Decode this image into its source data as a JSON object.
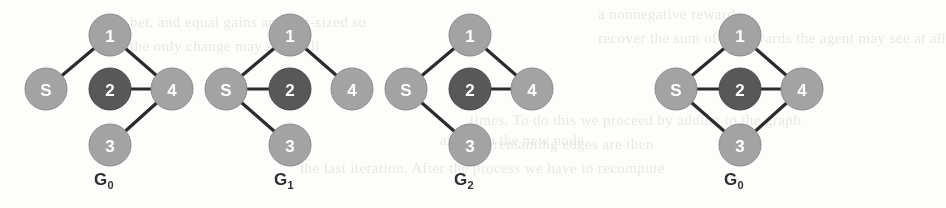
{
  "figure": {
    "background_color": "#fdfdfc",
    "width": 853,
    "height": 208,
    "node_colors": {
      "light": "#a3a3a3",
      "dark": "#585858",
      "stroke": "#8a8a8a",
      "dark_stroke": "#4a4a4a",
      "edge": "#2b2b2b",
      "label_text": "#ffffff"
    },
    "node_radius": 21,
    "edge_width": 3.2,
    "graphs": [
      {
        "id": "graph-g0-left",
        "caption_base": "G",
        "caption_sub": "0",
        "caption_x": 104,
        "caption_y": 170,
        "center_x": 104,
        "nodes": [
          {
            "id": "1",
            "label": "1",
            "x": 110,
            "y": 35,
            "shade": "light"
          },
          {
            "id": "S",
            "label": "S",
            "x": 46,
            "y": 89,
            "shade": "light"
          },
          {
            "id": "2",
            "label": "2",
            "x": 110,
            "y": 89,
            "shade": "dark"
          },
          {
            "id": "4",
            "label": "4",
            "x": 172,
            "y": 89,
            "shade": "light"
          },
          {
            "id": "3",
            "label": "3",
            "x": 110,
            "y": 145,
            "shade": "light"
          }
        ],
        "edges": [
          {
            "from": "S",
            "to": "1"
          },
          {
            "from": "1",
            "to": "4"
          },
          {
            "from": "2",
            "to": "4"
          },
          {
            "from": "3",
            "to": "4"
          }
        ]
      },
      {
        "id": "graph-g1",
        "caption_base": "G",
        "caption_sub": "1",
        "caption_x": 284,
        "caption_y": 170,
        "center_x": 284,
        "nodes": [
          {
            "id": "1",
            "label": "1",
            "x": 290,
            "y": 35,
            "shade": "light"
          },
          {
            "id": "S",
            "label": "S",
            "x": 226,
            "y": 89,
            "shade": "light"
          },
          {
            "id": "2",
            "label": "2",
            "x": 290,
            "y": 89,
            "shade": "dark"
          },
          {
            "id": "4",
            "label": "4",
            "x": 352,
            "y": 89,
            "shade": "light"
          },
          {
            "id": "3",
            "label": "3",
            "x": 290,
            "y": 145,
            "shade": "light"
          }
        ],
        "edges": [
          {
            "from": "S",
            "to": "1"
          },
          {
            "from": "S",
            "to": "2"
          },
          {
            "from": "S",
            "to": "3"
          },
          {
            "from": "1",
            "to": "4"
          }
        ]
      },
      {
        "id": "graph-g2",
        "caption_base": "G",
        "caption_sub": "2",
        "caption_x": 464,
        "caption_y": 170,
        "center_x": 464,
        "nodes": [
          {
            "id": "1",
            "label": "1",
            "x": 470,
            "y": 35,
            "shade": "light"
          },
          {
            "id": "S",
            "label": "S",
            "x": 406,
            "y": 89,
            "shade": "light"
          },
          {
            "id": "2",
            "label": "2",
            "x": 470,
            "y": 89,
            "shade": "dark"
          },
          {
            "id": "4",
            "label": "4",
            "x": 532,
            "y": 89,
            "shade": "light"
          },
          {
            "id": "3",
            "label": "3",
            "x": 470,
            "y": 145,
            "shade": "light"
          }
        ],
        "edges": [
          {
            "from": "S",
            "to": "1"
          },
          {
            "from": "S",
            "to": "3"
          },
          {
            "from": "1",
            "to": "4"
          },
          {
            "from": "2",
            "to": "4"
          }
        ]
      },
      {
        "id": "graph-g0-right",
        "caption_base": "G",
        "caption_sub": "0",
        "caption_x": 734,
        "caption_y": 170,
        "center_x": 734,
        "nodes": [
          {
            "id": "1",
            "label": "1",
            "x": 740,
            "y": 35,
            "shade": "light"
          },
          {
            "id": "S",
            "label": "S",
            "x": 676,
            "y": 89,
            "shade": "light"
          },
          {
            "id": "2",
            "label": "2",
            "x": 740,
            "y": 89,
            "shade": "dark"
          },
          {
            "id": "4",
            "label": "4",
            "x": 802,
            "y": 89,
            "shade": "light"
          },
          {
            "id": "3",
            "label": "3",
            "x": 740,
            "y": 145,
            "shade": "light"
          }
        ],
        "edges": [
          {
            "from": "S",
            "to": "1"
          },
          {
            "from": "S",
            "to": "2"
          },
          {
            "from": "S",
            "to": "3"
          },
          {
            "from": "1",
            "to": "4"
          },
          {
            "from": "2",
            "to": "4"
          },
          {
            "from": "3",
            "to": "4"
          }
        ]
      }
    ]
  },
  "background_bleed": {
    "description": "faint show-through of printed body text behind the figure",
    "lines": [
      {
        "text": "a nonnegative reward,",
        "x": 598,
        "y": 6
      },
      {
        "text": "bet, and equal gains are unit-sized so",
        "x": 130,
        "y": 14
      },
      {
        "text": "recover the sum of all rewards the agent may see at all",
        "x": 598,
        "y": 30
      },
      {
        "text": "the only change may show all",
        "x": 130,
        "y": 38
      },
      {
        "text": "times. To do this we proceed by adding to the graph",
        "x": 470,
        "y": 112
      },
      {
        "text": "and with the new node",
        "x": 440,
        "y": 132
      },
      {
        "text": "the remaining edges are then",
        "x": 470,
        "y": 136
      },
      {
        "text": "the last iteration. After the process we have to recompute",
        "x": 300,
        "y": 160
      }
    ]
  }
}
